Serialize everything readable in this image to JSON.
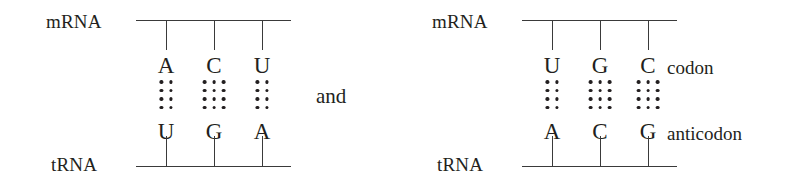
{
  "figure": {
    "conjunction": "and",
    "strand_labels": {
      "top": "mRNA",
      "bottom": "tRNA"
    },
    "annotations": {
      "codon": "codon",
      "anticodon": "anticodon"
    },
    "style": {
      "line_color": "#3a3a3a",
      "text_color": "#231f20",
      "background": "#ffffff"
    },
    "diagrams": [
      {
        "id": "left",
        "top_strand": "mRNA",
        "bottom_strand": "tRNA",
        "has_annotations": false,
        "pairs": [
          {
            "codon_base": "A",
            "anticodon_base": "U",
            "hydrogen_bonds": 2
          },
          {
            "codon_base": "C",
            "anticodon_base": "G",
            "hydrogen_bonds": 3
          },
          {
            "codon_base": "U",
            "anticodon_base": "A",
            "hydrogen_bonds": 2
          }
        ],
        "codon_sequence": "ACU",
        "anticodon_sequence": "UGA"
      },
      {
        "id": "right",
        "top_strand": "mRNA",
        "bottom_strand": "tRNA",
        "has_annotations": true,
        "pairs": [
          {
            "codon_base": "U",
            "anticodon_base": "A",
            "hydrogen_bonds": 2
          },
          {
            "codon_base": "G",
            "anticodon_base": "C",
            "hydrogen_bonds": 3
          },
          {
            "codon_base": "C",
            "anticodon_base": "G",
            "hydrogen_bonds": 3
          }
        ],
        "codon_sequence": "UGC",
        "anticodon_sequence": "ACG"
      }
    ],
    "layout": {
      "pair_x_positions": [
        148,
        196,
        244
      ],
      "dot_rows_per_bond": 4
    }
  }
}
